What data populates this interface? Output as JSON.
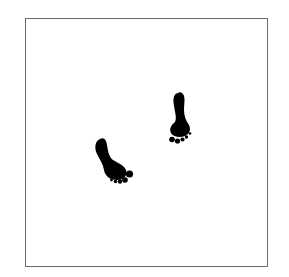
{
  "figure": {
    "border_color": "#6b6b6b",
    "background_color": "#ffffff",
    "ink_color": "#000000",
    "footprints": [
      {
        "id": "left-footprint",
        "x": 95,
        "y": 137
      },
      {
        "id": "right-footprint",
        "x": 168,
        "y": 92
      }
    ]
  }
}
